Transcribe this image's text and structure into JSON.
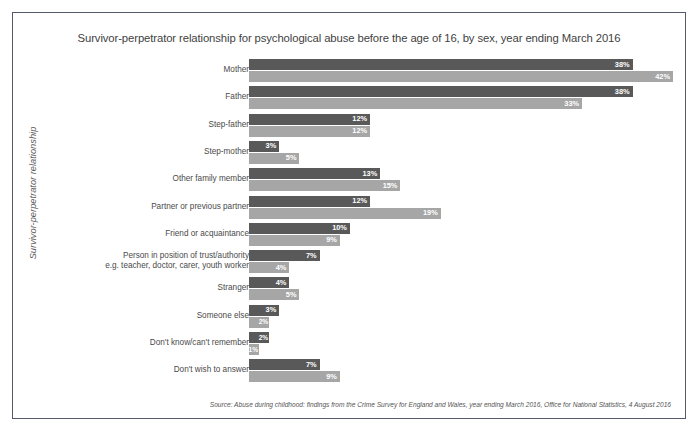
{
  "figure": {
    "title": "Survivor-perpetrator relationship for psychological abuse before the age of 16, by sex, year ending March 2016",
    "y_axis_title": "Survivor-perpetrator relationship",
    "source_note": "Source:  Abuse during childhood: findings from the Crime Survey for England and Wales, year ending March 2016, Office for National Statistics, 4 August 2016"
  },
  "colors": {
    "series_men": "#595959",
    "series_women": "#a6a6a6",
    "frame": "#55596b",
    "value_label": "#ffffff",
    "text": "#4a4a4a",
    "background": "#ffffff"
  },
  "chart_data": {
    "type": "bar",
    "orientation": "horizontal",
    "title": "Survivor-perpetrator relationship for psychological abuse before the age of 16, by sex, year ending March 2016",
    "xlabel": "",
    "ylabel": "Survivor-perpetrator relationship",
    "xlim": [
      0,
      42
    ],
    "grid": false,
    "legend": "none",
    "value_suffix": "%",
    "categories": [
      "Mother",
      "Father",
      "Step-father",
      "Step-mother",
      "Other family member",
      "Partner or previous partner",
      "Friend or acquaintance",
      "Person in position of trust/authority\ne.g. teacher, doctor, carer, youth worker",
      "Stranger",
      "Someone else",
      "Don't know/can't remember",
      "Don't wish to answer"
    ],
    "series": [
      {
        "name": "Men",
        "color": "#595959",
        "values": [
          38,
          38,
          12,
          3,
          13,
          12,
          10,
          7,
          4,
          3,
          2,
          7
        ],
        "labels": [
          "38%",
          "38%",
          "12%",
          "3%",
          "13%",
          "12%",
          "10%",
          "7%",
          "4%",
          "3%",
          "2%",
          "7%"
        ]
      },
      {
        "name": "Women",
        "color": "#a6a6a6",
        "values": [
          42,
          33,
          12,
          5,
          15,
          19,
          9,
          4,
          5,
          2,
          1,
          9
        ],
        "labels": [
          "42%",
          "33%",
          "12%",
          "5%",
          "15%",
          "19%",
          "9%",
          "4%",
          "5%",
          "2%",
          "1%",
          "9%"
        ]
      }
    ]
  }
}
